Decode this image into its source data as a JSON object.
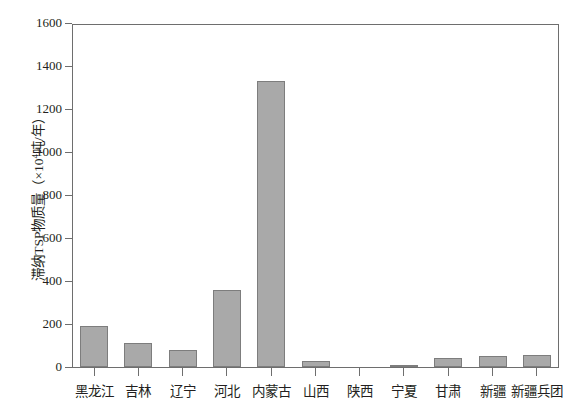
{
  "chart_data": {
    "type": "bar",
    "title": "",
    "xlabel": "",
    "ylabel": "滞纳TSP物质量（×10⁴吨/年）",
    "ylabel_prefix": "滞纳TSP物质量（×10",
    "ylabel_exponent": "4",
    "ylabel_suffix": "吨/年）",
    "categories": [
      "黑龙江",
      "吉林",
      "辽宁",
      "河北",
      "内蒙古",
      "山西",
      "陕西",
      "宁夏",
      "甘肃",
      "新疆",
      "新疆兵团"
    ],
    "values": [
      190,
      112,
      78,
      360,
      1330,
      28,
      0,
      6,
      40,
      50,
      55
    ],
    "ylim": [
      0,
      1600
    ],
    "ytick_values": [
      0,
      200,
      400,
      600,
      800,
      1000,
      1200,
      1400,
      1600
    ],
    "ytick_labels": [
      "0",
      "200",
      "400",
      "600",
      "800",
      "1000",
      "1200",
      "1400",
      "1600"
    ],
    "grid": false,
    "legend": null,
    "bar_fill_color": "#a9a9a9",
    "bar_border_color": "#7d7d7d",
    "axis_color": "#6e6e6e",
    "background_color": "#ffffff"
  }
}
